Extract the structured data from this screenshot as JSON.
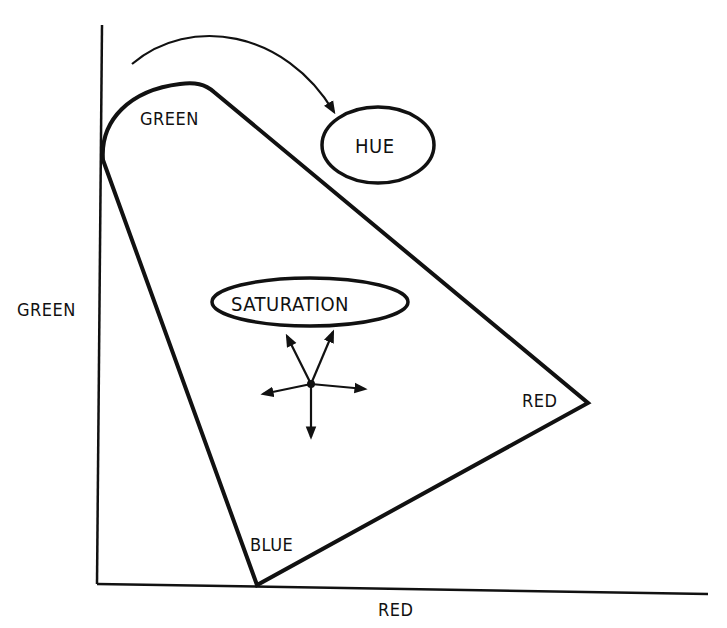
{
  "diagram": {
    "title": "",
    "axes": {
      "x_label": "RED",
      "y_label": "GREEN"
    },
    "gamut": {
      "vertices": [
        {
          "name": "green_vertex",
          "label": "GREEN"
        },
        {
          "name": "red_vertex",
          "label": "RED"
        },
        {
          "name": "blue_vertex",
          "label": "BLUE"
        }
      ]
    },
    "annotations": {
      "hue": "HUE",
      "saturation": "SATURATION"
    },
    "colors": {
      "ink": "#111111",
      "background": "#ffffff"
    }
  }
}
